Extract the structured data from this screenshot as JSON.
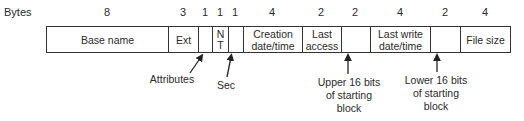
{
  "diagram": {
    "bytes_label": "Bytes",
    "fields": [
      {
        "name": "Base name",
        "size": "8"
      },
      {
        "name": "Ext",
        "size": "3"
      },
      {
        "name": "",
        "size": "1"
      },
      {
        "name": "N\nT",
        "size": "1"
      },
      {
        "name": "",
        "size": "1"
      },
      {
        "name": "Creation date/time",
        "size": "4"
      },
      {
        "name": "Last access",
        "size": "2"
      },
      {
        "name": "",
        "size": "2"
      },
      {
        "name": "Last write date/time",
        "size": "4"
      },
      {
        "name": "",
        "size": "2"
      },
      {
        "name": "File size",
        "size": "4"
      }
    ],
    "annotations": [
      {
        "label": "Attributes",
        "points_to_field_index": 2
      },
      {
        "label": "Sec",
        "points_to_field_index": 4
      },
      {
        "label": "Upper 16 bits of starting block",
        "points_to_field_index": 7
      },
      {
        "label": "Lower 16 bits of starting block",
        "points_to_field_index": 9
      }
    ],
    "colors": {
      "line": "#333333",
      "text": "#2a2a2a",
      "background": "#ffffff"
    }
  }
}
